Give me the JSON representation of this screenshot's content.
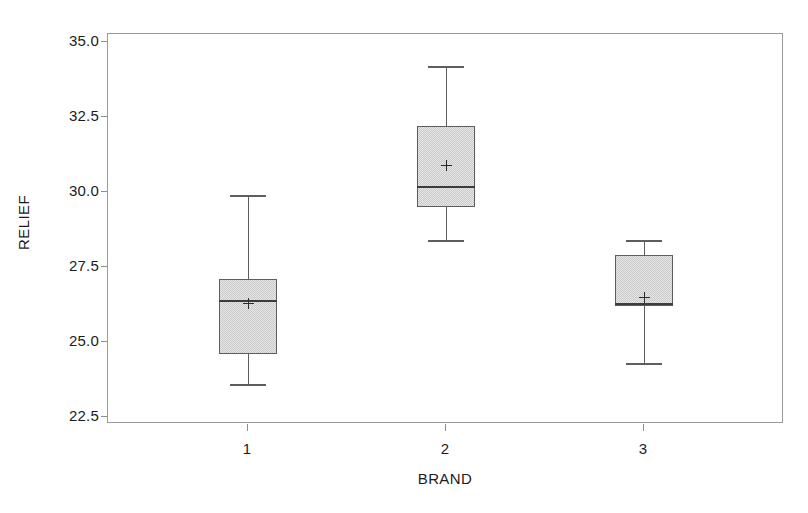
{
  "chart_data": {
    "type": "box",
    "title": "",
    "xlabel": "BRAND",
    "ylabel": "RELIEF",
    "grid": false,
    "legend": null,
    "ylim": [
      22.5,
      35.0
    ],
    "yticks": [
      "35.0",
      "32.5",
      "30.0",
      "27.5",
      "25.0",
      "22.5"
    ],
    "ytick_values": [
      35.0,
      32.5,
      30.0,
      27.5,
      25.0,
      22.5
    ],
    "categories": [
      "1",
      "2",
      "3"
    ],
    "boxes": [
      {
        "category": "1",
        "whisker_low": 23.6,
        "q1": 24.6,
        "median": 26.4,
        "mean": 26.3,
        "q3": 27.1,
        "whisker_high": 29.9
      },
      {
        "category": "2",
        "whisker_low": 28.4,
        "q1": 29.5,
        "median": 30.2,
        "mean": 30.9,
        "q3": 32.2,
        "whisker_high": 34.2
      },
      {
        "category": "3",
        "whisker_low": 24.3,
        "q1": 26.2,
        "median": 26.3,
        "mean": 26.5,
        "q3": 27.9,
        "whisker_high": 28.4
      }
    ],
    "colors": {
      "box_fill": "#c9c9c9",
      "box_edge": "#5e5e5e",
      "median": "#3c3c3c",
      "mean_marker": "#2a2a2a",
      "frame": "#9a9a9a",
      "background": "#ffffff"
    },
    "mean_marker_symbol": "+"
  },
  "axis": {
    "y_title": "RELIEF",
    "x_title": "BRAND"
  }
}
